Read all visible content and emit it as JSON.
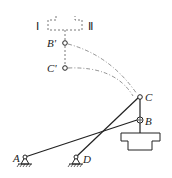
{
  "diagram": {
    "labels": {
      "position_I": "Ⅰ",
      "position_II": "Ⅱ",
      "B_prime": "B'",
      "C_prime": "C'",
      "C": "C",
      "B": "B",
      "A": "A",
      "D": "D"
    },
    "colors": {
      "stroke": "#222222",
      "dashed": "#555555",
      "background": "#ffffff"
    }
  }
}
